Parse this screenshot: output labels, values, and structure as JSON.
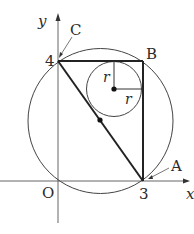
{
  "diagram": {
    "axes": {
      "x_label": "x",
      "y_label": "y",
      "origin_label": "O"
    },
    "ticks": {
      "x_tick": "3",
      "y_tick": "4"
    },
    "points": {
      "A": "A",
      "B": "B",
      "C": "C"
    },
    "radius_labels": {
      "vertical": "r",
      "horizontal": "r"
    },
    "geometry": {
      "triangle_vertices": [
        [
          0,
          0
        ],
        [
          3,
          0
        ],
        [
          3,
          4
        ],
        [
          0,
          4
        ]
      ],
      "right_triangle": [
        [
          0,
          4
        ],
        [
          3,
          4
        ],
        [
          3,
          0
        ]
      ],
      "circumcircle_center": [
        1.5,
        2
      ],
      "circumcircle_radius": 2.5,
      "incircle_center": [
        2,
        3
      ],
      "incircle_radius": 1,
      "hypotenuse_midpoint": [
        1.5,
        2
      ]
    },
    "colors": {
      "stroke": "#2b2b2b",
      "background": "#ffffff"
    }
  }
}
